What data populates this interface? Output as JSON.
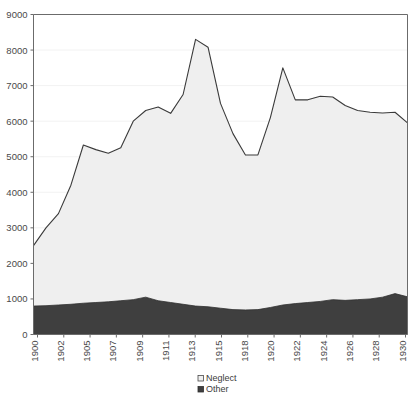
{
  "chart_data": {
    "type": "area",
    "stacked": true,
    "title": "",
    "subtitle": "",
    "xlabel": "",
    "ylabel": "",
    "ylim": [
      0,
      9000
    ],
    "ytick_step": 1000,
    "yticks": [
      "0",
      "1000",
      "2000",
      "3000",
      "4000",
      "5000",
      "6000",
      "7000",
      "8000",
      "9000"
    ],
    "grid": true,
    "legend_position": "bottom-center",
    "xlim": [
      1900,
      1930
    ],
    "x": [
      1900,
      1901,
      1902,
      1903,
      1904,
      1905,
      1906,
      1907,
      1908,
      1909,
      1910,
      1911,
      1912,
      1913,
      1914,
      1915,
      1916,
      1917,
      1918,
      1919,
      1920,
      1921,
      1922,
      1923,
      1924,
      1925,
      1926,
      1927,
      1928,
      1929,
      1930
    ],
    "xtick_labels": [
      "1900",
      "1902",
      "1905",
      "1907",
      "1909",
      "1911",
      "1913",
      "1915",
      "1918",
      "1920",
      "1922",
      "1924",
      "1926",
      "1928",
      "1930"
    ],
    "xtick_years": [
      1900,
      1902,
      1905,
      1907,
      1909,
      1911,
      1913,
      1915,
      1918,
      1920,
      1922,
      1924,
      1926,
      1928,
      1930
    ],
    "xtick_label_rotation": -90,
    "series": [
      {
        "name": "Other",
        "color": "#3f3f3f",
        "values": [
          800,
          810,
          830,
          850,
          880,
          900,
          920,
          950,
          980,
          1050,
          950,
          900,
          850,
          800,
          780,
          740,
          700,
          690,
          700,
          760,
          830,
          870,
          900,
          930,
          980,
          960,
          980,
          1000,
          1050,
          1150,
          1060
        ]
      },
      {
        "name": "Neglect",
        "color": "#efefef",
        "values": [
          1700,
          2190,
          2570,
          3350,
          4450,
          4300,
          4180,
          4300,
          5020,
          5250,
          5450,
          5320,
          5900,
          7500,
          7300,
          5760,
          4950,
          4360,
          4350,
          5340,
          6670,
          5730,
          5700,
          5770,
          5700,
          5480,
          5320,
          5250,
          5180,
          5100,
          4890
        ]
      }
    ],
    "totals": [
      2500,
      3000,
      3400,
      4200,
      5330,
      5200,
      5100,
      5250,
      6000,
      6300,
      6400,
      6220,
      6750,
      8300,
      8080,
      6500,
      5650,
      5050,
      5050,
      6100,
      7500,
      6600,
      6600,
      6700,
      6680,
      6440,
      6300,
      6250,
      6230,
      6250,
      5950
    ],
    "legend": [
      {
        "label": "Neglect",
        "marker": "open-square",
        "color": "#efefef"
      },
      {
        "label": "Other",
        "marker": "filled-square",
        "color": "#3f3f3f"
      }
    ],
    "axis_color": "#6b6b6b",
    "grid_color": "#f2f2f2",
    "background": "#ffffff"
  }
}
